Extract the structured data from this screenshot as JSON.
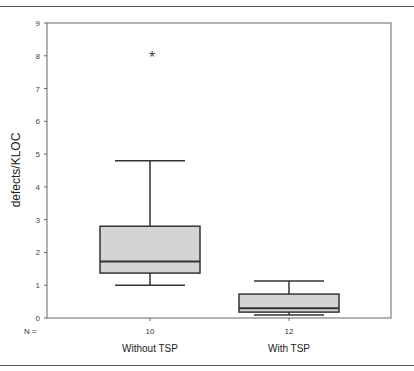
{
  "chart_data": {
    "type": "boxplot",
    "title": "",
    "xlabel": "",
    "ylabel": "defects/KLOC",
    "ylim": [
      0,
      9
    ],
    "yticks": [
      0,
      1,
      2,
      3,
      4,
      5,
      6,
      7,
      8,
      9
    ],
    "grid": false,
    "legend": null,
    "n_prefix": "N =",
    "categories": [
      "Without TSP",
      "With TSP"
    ],
    "series": [
      {
        "name": "Without TSP",
        "n": 10,
        "whisker_low": 1.0,
        "q1": 1.37,
        "median": 1.72,
        "q3": 2.8,
        "whisker_high": 4.8,
        "outliers": [
          8.0
        ],
        "outlier_marker": "*"
      },
      {
        "name": "With TSP",
        "n": 12,
        "whisker_low": 0.09,
        "q1": 0.18,
        "median": 0.3,
        "q3": 0.73,
        "whisker_high": 1.13,
        "outliers": []
      }
    ],
    "colors": {
      "box_fill": "#d4d4d4",
      "line": "#333333",
      "axis": "#666666"
    }
  }
}
